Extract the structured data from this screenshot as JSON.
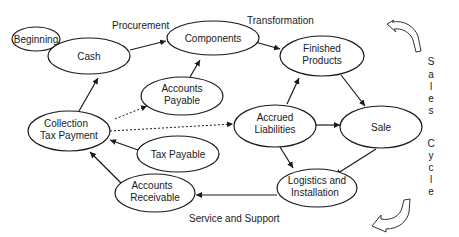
{
  "diagram": {
    "section_labels": {
      "procurement": "Procurement",
      "transformation": "Transformation",
      "service": "Service and Support"
    },
    "side_label": {
      "word1": [
        "S",
        "a",
        "l",
        "e",
        "s"
      ],
      "word2": [
        "C",
        "y",
        "c",
        "l",
        "e"
      ]
    },
    "nodes": {
      "beginning": {
        "line1": "Beginning"
      },
      "cash": {
        "line1": "Cash"
      },
      "components": {
        "line1": "Components"
      },
      "finished": {
        "line1": "Finished",
        "line2": "Products"
      },
      "payable": {
        "line1": "Accounts",
        "line2": "Payable"
      },
      "collection": {
        "line1": "Collection",
        "line2": "Tax Payment"
      },
      "accrued": {
        "line1": "Accrued",
        "line2": "Liabilities"
      },
      "sale": {
        "line1": "Sale"
      },
      "taxpayable": {
        "line1": "Tax Payable"
      },
      "receivable": {
        "line1": "Accounts",
        "line2": "Receivable"
      },
      "logistics": {
        "line1": "Logistics and",
        "line2": "Installation"
      }
    },
    "edges": [
      {
        "from": "cash",
        "to": "components",
        "style": "solid"
      },
      {
        "from": "components",
        "to": "finished",
        "style": "solid"
      },
      {
        "from": "payable",
        "to": "components",
        "style": "solid"
      },
      {
        "from": "accrued",
        "to": "finished",
        "style": "solid"
      },
      {
        "from": "finished",
        "to": "sale",
        "style": "solid"
      },
      {
        "from": "accrued",
        "to": "sale",
        "style": "solid"
      },
      {
        "from": "accrued",
        "to": "logistics",
        "style": "solid"
      },
      {
        "from": "sale",
        "to": "logistics",
        "style": "solid"
      },
      {
        "from": "logistics",
        "to": "receivable",
        "style": "solid"
      },
      {
        "from": "receivable",
        "to": "collection",
        "style": "solid"
      },
      {
        "from": "taxpayable",
        "to": "collection",
        "style": "solid"
      },
      {
        "from": "collection",
        "to": "cash",
        "style": "solid"
      },
      {
        "from": "collection",
        "to": "payable",
        "style": "dashed"
      },
      {
        "from": "collection",
        "to": "accrued",
        "style": "dashed"
      }
    ]
  }
}
